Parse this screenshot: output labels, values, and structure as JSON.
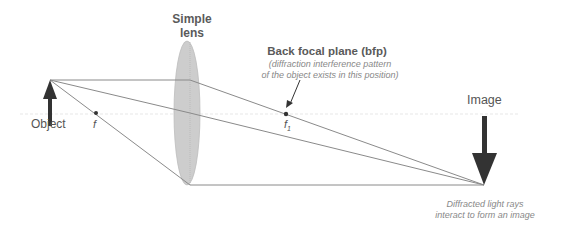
{
  "diagram": {
    "lens_label": [
      "Simple",
      "lens"
    ],
    "bfp_title": "Back focal plane (bfp)",
    "bfp_note": [
      "(diffraction interference pattern",
      "of the object exists in this position)"
    ],
    "object_label": "Object",
    "focal_label": "f",
    "back_focal_label": "f",
    "back_focal_subscript": "1",
    "image_label": "Image",
    "image_note": [
      "Diffracted light rays",
      "interact to form an image"
    ],
    "colors": {
      "lens_fill": "#cfcfcf",
      "ray": "#8a8a8a",
      "arrow": "#333333",
      "axis": "#e6e6e6"
    }
  }
}
